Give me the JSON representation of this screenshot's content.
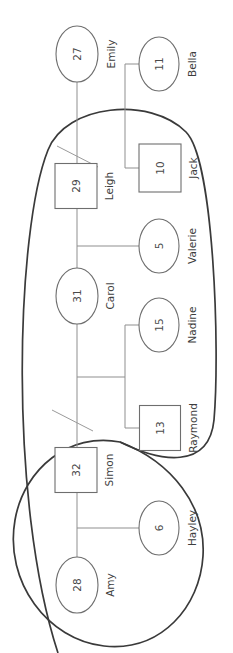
{
  "diagram": {
    "type": "genogram",
    "orientation": "rotated-90",
    "canvas": {
      "width": 233,
      "height": 653
    },
    "background_color": "#ffffff",
    "node_stroke_color": "#6e6e6e",
    "boundary_stroke_color": "#3a3a3a",
    "link_stroke_color": "#8f8f8f"
  },
  "chart_data": {
    "type": "diagram",
    "title": "",
    "nodes": [
      {
        "id": "emily",
        "label": "Emily",
        "value": "27",
        "shape": "ellipse",
        "cx": 77,
        "cy": 54,
        "rx": 21,
        "ry": 28,
        "label_x": 111,
        "label_y": 54
      },
      {
        "id": "bella",
        "label": "Bella",
        "value": "11",
        "shape": "ellipse",
        "cx": 159,
        "cy": 64,
        "rx": 20,
        "ry": 27,
        "label_x": 192,
        "label_y": 64
      },
      {
        "id": "jack",
        "label": "Jack",
        "value": "10",
        "shape": "rectangle",
        "cx": 160,
        "cy": 168,
        "w": 42,
        "h": 48,
        "label_x": 193,
        "label_y": 168
      },
      {
        "id": "leigh",
        "label": "Leigh",
        "value": "29",
        "shape": "rectangle",
        "cx": 76,
        "cy": 186,
        "w": 42,
        "h": 45,
        "label_x": 109,
        "label_y": 186
      },
      {
        "id": "valerie",
        "label": "Valerie",
        "value": "5",
        "shape": "ellipse",
        "cx": 159,
        "cy": 246,
        "rx": 20,
        "ry": 27,
        "label_x": 192,
        "label_y": 246
      },
      {
        "id": "carol",
        "label": "Carol",
        "value": "31",
        "shape": "ellipse",
        "cx": 77,
        "cy": 296,
        "rx": 21,
        "ry": 28,
        "label_x": 110,
        "label_y": 296
      },
      {
        "id": "nadine",
        "label": "Nadine",
        "value": "15",
        "shape": "ellipse",
        "cx": 159,
        "cy": 325,
        "rx": 20,
        "ry": 27,
        "label_x": 192,
        "label_y": 325
      },
      {
        "id": "raymond",
        "label": "Raymond",
        "value": "13",
        "shape": "rectangle",
        "cx": 160,
        "cy": 428,
        "w": 41,
        "h": 45,
        "label_x": 193,
        "label_y": 428
      },
      {
        "id": "simon",
        "label": "Simon",
        "value": "32",
        "shape": "rectangle",
        "cx": 76,
        "cy": 470,
        "w": 42,
        "h": 45,
        "label_x": 109,
        "label_y": 470
      },
      {
        "id": "hayley",
        "label": "Hayley",
        "value": "6",
        "shape": "ellipse",
        "cx": 159,
        "cy": 528,
        "rx": 20,
        "ry": 27,
        "label_x": 192,
        "label_y": 528
      },
      {
        "id": "amy",
        "label": "Amy",
        "value": "28",
        "shape": "ellipse",
        "cx": 77,
        "cy": 585,
        "rx": 21,
        "ry": 28,
        "label_x": 110,
        "label_y": 585
      }
    ],
    "edges": [
      {
        "id": "emily-leigh",
        "path": "M 77 82 L 77 163"
      },
      {
        "id": "bella-spine",
        "path": "M 139 64 L 125 64 L 125 168 L 139 168"
      },
      {
        "id": "leigh-carol",
        "path": "M 77 209 L 77 268"
      },
      {
        "id": "valerie-branch",
        "path": "M 77 246 L 139 246"
      },
      {
        "id": "carol-down",
        "path": "M 77 324 L 77 470"
      },
      {
        "id": "nadine-spine",
        "path": "M 139 325 L 125 325 L 125 428 L 139 428"
      },
      {
        "id": "sibling-connector",
        "path": "M 77 377 L 125 377"
      },
      {
        "id": "simon-amy",
        "path": "M 77 493 L 77 557"
      },
      {
        "id": "hayley-branch",
        "path": "M 77 528 L 139 528"
      }
    ],
    "separation_marks": [
      {
        "id": "separation-emily-leigh",
        "path": "M 57 146 L 98 167"
      },
      {
        "id": "separation-carol-simon",
        "path": "M 52 410 L 93 431"
      }
    ],
    "households": [
      {
        "id": "household-upper",
        "members": [
          "leigh",
          "jack",
          "valerie",
          "carol",
          "nadine",
          "raymond"
        ],
        "path": "M 58 653 C 8 500 16 230 48 150 C 66 104 150 96 186 132 C 214 160 220 350 214 420 C 209 470 160 462 120 442"
      },
      {
        "id": "household-lower",
        "members": [
          "simon",
          "hayley",
          "amy"
        ],
        "path": "M 120 442 C 70 432 24 468 15 520 C 4 582 48 640 104 646 C 162 652 200 606 203 556 C 206 506 172 462 120 442 Z"
      }
    ]
  }
}
